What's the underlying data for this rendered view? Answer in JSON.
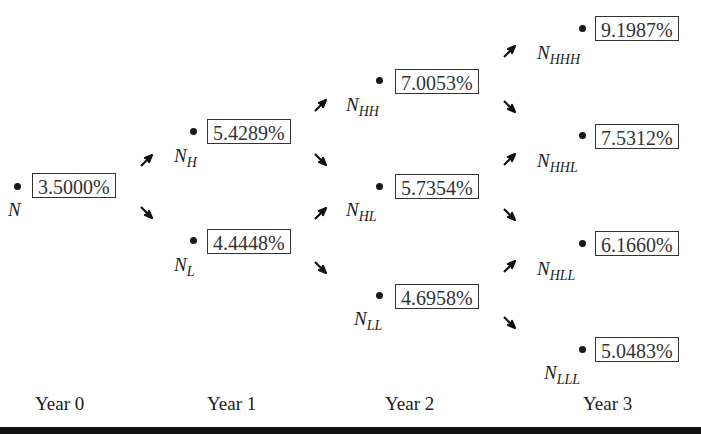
{
  "title": {
    "text": "",
    "note": "cut off at top edge"
  },
  "years": [
    "Year 0",
    "Year 1",
    "Year 2",
    "Year 3"
  ],
  "nodes": {
    "N": {
      "base": "N",
      "sub": "",
      "rate": "3.5000%"
    },
    "NH": {
      "base": "N",
      "sub": "H",
      "rate": "5.4289%"
    },
    "NL": {
      "base": "N",
      "sub": "L",
      "rate": "4.4448%"
    },
    "NHH": {
      "base": "N",
      "sub": "HH",
      "rate": "7.0053%"
    },
    "NHL": {
      "base": "N",
      "sub": "HL",
      "rate": "5.7354%"
    },
    "NLL": {
      "base": "N",
      "sub": "LL",
      "rate": "4.6958%"
    },
    "NHHH": {
      "base": "N",
      "sub": "HHH",
      "rate": "9.1987%"
    },
    "NHHL": {
      "base": "N",
      "sub": "HHL",
      "rate": "7.5312%"
    },
    "NHLL": {
      "base": "N",
      "sub": "HLL",
      "rate": "6.1660%"
    },
    "NLLL": {
      "base": "N",
      "sub": "LLL",
      "rate": "5.0483%"
    }
  },
  "arrow_icons": {
    "up": "arrow-up-right-icon",
    "down": "arrow-down-right-icon"
  },
  "colors": {
    "text": "#1a1a1a",
    "box_border": "#333333",
    "bottom_bar": "#111111"
  }
}
